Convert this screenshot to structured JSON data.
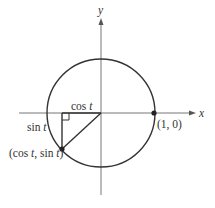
{
  "diagram": {
    "axes": {
      "x_label": "x",
      "y_label": "y"
    },
    "labels": {
      "cos_label_fn": "cos ",
      "cos_label_var": "t",
      "sin_label_fn": "sin ",
      "sin_label_var": "t",
      "point_label_open": "(cos ",
      "point_label_var1": "t",
      "point_label_mid": ", sin ",
      "point_label_var2": "t",
      "point_label_close": ")",
      "unit_point_label": "(1, 0)"
    },
    "points": [
      {
        "name": "unit-point",
        "coords": "(1, 0)"
      },
      {
        "name": "terminal-point",
        "coords": "(cos t, sin t)"
      }
    ],
    "colors": {
      "stroke": "#333333",
      "axis": "#666666"
    }
  }
}
